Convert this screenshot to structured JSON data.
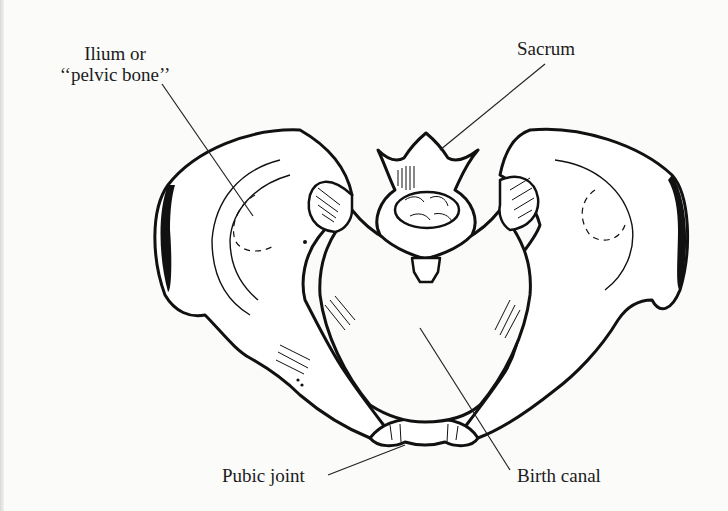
{
  "figure": {
    "labels": {
      "ilium_line1": "Ilium or",
      "ilium_line2": "‘‘pelvic bone’’",
      "sacrum": "Sacrum",
      "pubic_joint": "Pubic joint",
      "birth_canal": "Birth canal"
    },
    "colors": {
      "ink": "#111111",
      "paper": "#fbfbfa",
      "bone": "#ffffff"
    }
  }
}
